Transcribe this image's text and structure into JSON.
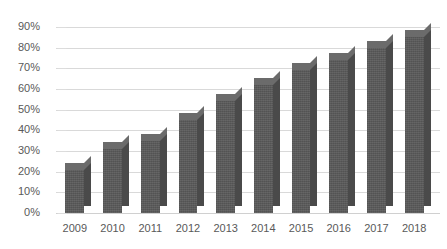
{
  "chart_data": {
    "type": "bar",
    "title": "",
    "xlabel": "",
    "ylabel": "",
    "categories": [
      "2009",
      "2010",
      "2011",
      "2012",
      "2013",
      "2014",
      "2015",
      "2016",
      "2017",
      "2018"
    ],
    "values": [
      21,
      31,
      35,
      45,
      54,
      62,
      69,
      74,
      80,
      85
    ],
    "ylim": [
      0,
      90
    ],
    "yticks": [
      "0%",
      "10%",
      "20%",
      "30%",
      "40%",
      "50%",
      "60%",
      "70%",
      "80%",
      "90%"
    ],
    "ytick_values": [
      0,
      10,
      20,
      30,
      40,
      50,
      60,
      70,
      80,
      90
    ],
    "grid": true,
    "legend": false,
    "series": [
      {
        "name": "",
        "values": [
          21,
          31,
          35,
          45,
          54,
          62,
          69,
          74,
          80,
          85
        ]
      }
    ],
    "style": {
      "bar_color": "#5a5a5a",
      "bar_side_color": "#4a4a4a",
      "bar_top_color": "#6b6b6b",
      "gridline_color": "#d9d9d9",
      "text_color": "#595959",
      "background": "#ffffff",
      "three_d": true
    }
  }
}
